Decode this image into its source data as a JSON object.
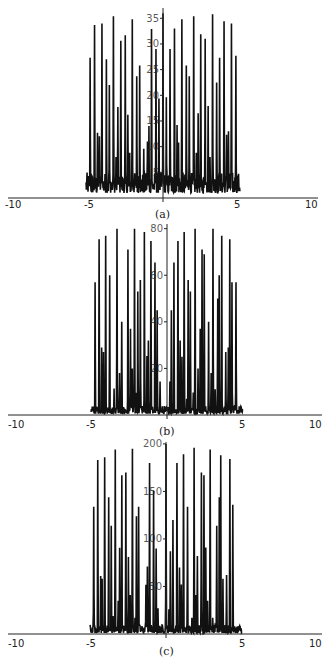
{
  "chart_data": [
    {
      "type": "line",
      "panel_label": "(a)",
      "title": "",
      "xlabel": "",
      "ylabel": "",
      "xlim": [
        -10,
        10
      ],
      "ylim": [
        0,
        37
      ],
      "x_ticks": [
        -10,
        -5,
        5,
        10
      ],
      "x_tick_labels": [
        "-10",
        "-5",
        "5",
        "10"
      ],
      "y_ticks": [
        5,
        10,
        15,
        20,
        25,
        30,
        35
      ],
      "y_tick_labels": [
        "5",
        "10",
        "15",
        "20",
        "25",
        "30",
        "35"
      ],
      "grid": false,
      "legend": null,
      "noise_floor": [
        1,
        5
      ],
      "peaks": {
        "x": [
          -9.85,
          -9.25,
          -8.85,
          -8.6,
          -8.25,
          -7.65,
          -7.25,
          -6.7,
          -6.35,
          -6.1,
          -5.7,
          -5.1,
          -4.75,
          -4.5,
          -4.15,
          -3.55,
          -3.15,
          -2.6,
          -2.1,
          -1.9,
          -1.55,
          -0.95,
          -0.55,
          0.0,
          0.45,
          0.95,
          1.55,
          1.9,
          2.1,
          2.55,
          3.15,
          3.55,
          4.15,
          4.5,
          4.75,
          5.1,
          5.7,
          6.1,
          6.35,
          6.7,
          7.25,
          7.65,
          8.25,
          8.6,
          8.85,
          9.25,
          9.85
        ],
        "y": [
          27.3,
          33.7,
          12.7,
          12.0,
          34.0,
          27.0,
          22.0,
          35.4,
          8.0,
          17.7,
          30.6,
          31.7,
          16.2,
          8.8,
          34.8,
          23.7,
          25.8,
          9.6,
          11.0,
          14.0,
          32.9,
          29.0,
          19.4,
          36.0,
          19.6,
          29.0,
          33.0,
          14.2,
          10.8,
          34.8,
          25.8,
          23.7,
          35.4,
          8.8,
          16.5,
          31.9,
          31.0,
          17.9,
          8.0,
          35.8,
          22.5,
          27.3,
          34.4,
          12.3,
          13.0,
          34.0,
          27.7
        ]
      }
    },
    {
      "type": "line",
      "panel_label": "(b)",
      "title": "",
      "xlabel": "",
      "ylabel": "",
      "xlim": [
        -10,
        10
      ],
      "ylim": [
        0,
        82
      ],
      "x_ticks": [
        -10,
        -5,
        5,
        10
      ],
      "x_tick_labels": [
        "-10",
        "-5",
        "5",
        "10"
      ],
      "y_ticks": [
        20,
        40,
        60,
        80
      ],
      "y_tick_labels": [
        "20",
        "40",
        "60",
        "80"
      ],
      "grid": false,
      "legend": null,
      "noise_floor": [
        0.5,
        4
      ],
      "peaks": {
        "x": [
          -9.85,
          -9.3,
          -8.95,
          -8.7,
          -8.4,
          -7.85,
          -7.25,
          -6.85,
          -6.5,
          -6.2,
          -5.35,
          -5.0,
          -4.75,
          -4.45,
          -4.25,
          -4.0,
          -3.65,
          -3.1,
          -2.75,
          -2.55,
          -2.2,
          -1.65,
          -1.35,
          -0.95,
          0.4,
          0.6,
          0.95,
          1.5,
          1.8,
          2.05,
          2.35,
          2.7,
          2.9,
          3.2,
          3.6,
          3.85,
          4.25,
          4.55,
          4.8,
          5.1,
          5.7,
          6.05,
          6.3,
          6.6,
          6.95,
          7.15,
          7.5,
          8.05,
          8.4,
          8.6,
          8.9,
          9.45
        ],
        "y": [
          57,
          75.5,
          29,
          27,
          77,
          60,
          11,
          80,
          18,
          40,
          71,
          37,
          20,
          80,
          9.6,
          53,
          58,
          78.6,
          25,
          32,
          74.7,
          65.5,
          45,
          14.4,
          14.4,
          45,
          65.5,
          74.7,
          32,
          25,
          78.6,
          7,
          58,
          53,
          9.6,
          80,
          20,
          37,
          71,
          69,
          40,
          18,
          80,
          11,
          50,
          60,
          77,
          27,
          29,
          75.5,
          57,
          57
        ]
      }
    },
    {
      "type": "line",
      "panel_label": "(c)",
      "title": "",
      "xlabel": "",
      "ylabel": "",
      "xlim": [
        -10,
        10
      ],
      "ylim": [
        0,
        202
      ],
      "x_ticks": [
        -10,
        -5,
        5,
        10
      ],
      "x_tick_labels": [
        "-10",
        "-5",
        "5",
        "10"
      ],
      "y_ticks": [
        50,
        100,
        150,
        200
      ],
      "y_tick_labels": [
        "50",
        "100",
        "150",
        "200"
      ],
      "grid": false,
      "legend": null,
      "noise_floor": [
        1,
        10
      ],
      "peaks": {
        "x": [
          -9.9,
          -9.35,
          -8.95,
          -8.75,
          -8.4,
          -7.85,
          -7.5,
          -7.25,
          -6.95,
          -6.55,
          -6.35,
          -6.05,
          -5.5,
          -5.15,
          -4.9,
          -4.6,
          -4.25,
          -4.05,
          -3.75,
          -2.75,
          -2.55,
          -2.25,
          -1.7,
          -1.35,
          -1.1,
          0.0,
          0.4,
          0.6,
          0.95,
          1.5,
          1.85,
          2.1,
          2.4,
          2.95,
          3.55,
          3.85,
          4.05,
          4.3,
          4.85,
          5.2,
          5.45,
          5.7,
          6.05,
          6.4,
          6.95,
          7.3,
          7.5,
          7.8,
          8.3,
          8.75,
          9.15
        ],
        "y": [
          134,
          183,
          61,
          58,
          186,
          144,
          114,
          18,
          194,
          35,
          90,
          167,
          170,
          81,
          41,
          195,
          17,
          124,
          134,
          51,
          71,
          180,
          151,
          90,
          27,
          200,
          26,
          87,
          120,
          180,
          70,
          52,
          189,
          134,
          17,
          196,
          41,
          82,
          170,
          167,
          91,
          35,
          194,
          17,
          114,
          144,
          188,
          58,
          62,
          184,
          136
        ]
      }
    }
  ],
  "panels": {
    "a": {
      "caption": "(a)",
      "x_labels": [
        "-10",
        "-5",
        "5",
        "10"
      ],
      "y_labels": [
        "5",
        "10",
        "15",
        "20",
        "25",
        "30",
        "35"
      ]
    },
    "b": {
      "caption": "(b)",
      "x_labels": [
        "-10",
        "-5",
        "5",
        "10"
      ],
      "y_labels": [
        "20",
        "40",
        "60",
        "80"
      ]
    },
    "c": {
      "caption": "(c)",
      "x_labels": [
        "-10",
        "-5",
        "5",
        "10"
      ],
      "y_labels": [
        "50",
        "100",
        "150",
        "200"
      ]
    }
  },
  "colors": {
    "line": "#111111",
    "axis": "#222222",
    "background": "#ffffff"
  }
}
